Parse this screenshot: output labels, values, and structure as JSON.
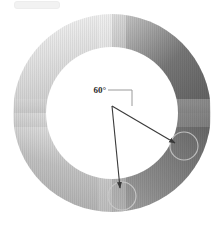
{
  "figure": {
    "annotation": {
      "angle_label": "60°",
      "label_x": 93,
      "label_y": 90
    },
    "ring": {
      "center_x": 112,
      "center_y": 113,
      "outer_radius": 99,
      "inner_radius": 66,
      "gradient_stops": [
        {
          "angle_deg": 0,
          "color": "#f4f4f4"
        },
        {
          "angle_deg": 45,
          "color": "#b8b8b8"
        },
        {
          "angle_deg": 80,
          "color": "#6d6d6d"
        },
        {
          "angle_deg": 120,
          "color": "#464646"
        },
        {
          "angle_deg": 170,
          "color": "#4c4c4c"
        },
        {
          "angle_deg": 210,
          "color": "#787878"
        },
        {
          "angle_deg": 250,
          "color": "#9e9e9e"
        },
        {
          "angle_deg": 290,
          "color": "#a9a9a9"
        },
        {
          "angle_deg": 330,
          "color": "#d6d6d6"
        },
        {
          "angle_deg": 360,
          "color": "#f4f4f4"
        }
      ]
    },
    "apex": {
      "x": 112,
      "y": 106
    },
    "leader": {
      "from_x": 108,
      "from_y": 90,
      "corner_x": 132,
      "corner_y": 90,
      "to_x": 132,
      "to_y": 106
    },
    "arrows": [
      {
        "name": "right-arrow",
        "tip_x": 175,
        "tip_y": 143,
        "target_circle_cx": 184,
        "target_circle_cy": 146,
        "target_circle_r": 14
      },
      {
        "name": "down-arrow",
        "tip_x": 120,
        "tip_y": 188,
        "target_circle_cx": 122,
        "target_circle_cy": 196,
        "target_circle_r": 14
      }
    ],
    "stroke_color": "#3a3a3a",
    "circle_outline_color": "#b9b9b9",
    "background": "#ffffff"
  }
}
